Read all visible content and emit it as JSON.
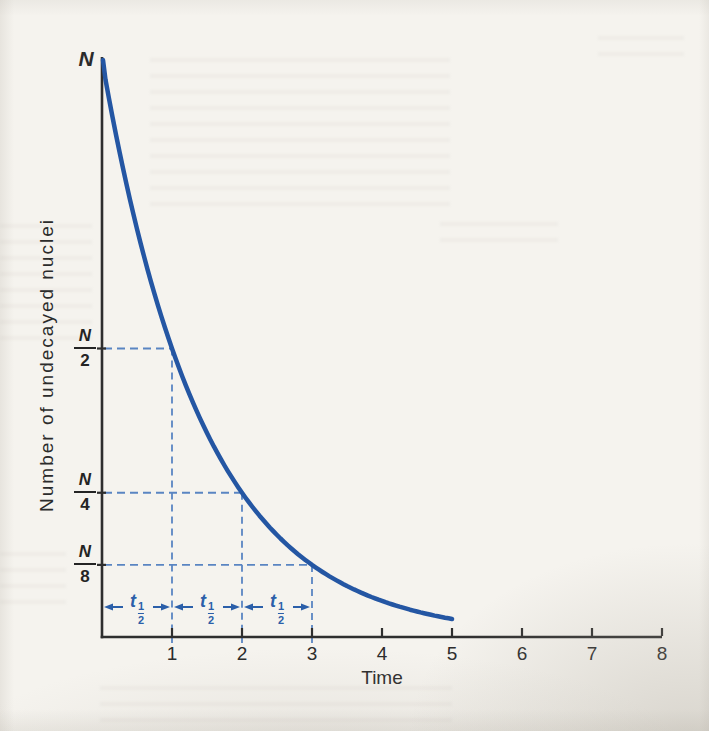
{
  "chart": {
    "top_label": "N",
    "xlabel": "Time",
    "ylabel": "Number of undecayed nuclei",
    "fractions": [
      {
        "num": "N",
        "den": "2"
      },
      {
        "num": "N",
        "den": "4"
      },
      {
        "num": "N",
        "den": "8"
      }
    ],
    "half_life": {
      "base": "t",
      "num": "1",
      "den": "2"
    }
  },
  "chart_data": {
    "type": "line",
    "title": "",
    "xlabel": "Time",
    "ylabel": "Number of undecayed nuclei",
    "xlim": [
      0,
      8
    ],
    "ylim": [
      0,
      1
    ],
    "x_ticks": [
      1,
      2,
      3,
      4,
      5,
      6,
      7,
      8
    ],
    "grid": false,
    "y_unit": "N",
    "curve": {
      "name": "radioactive-decay",
      "equation": "N(t) = N · (1/2)^t",
      "half_life": 1,
      "t_range": [
        0,
        5
      ],
      "key_points": [
        {
          "t": 0,
          "value_label": "N",
          "fraction_of_N": 1
        },
        {
          "t": 1,
          "value_label": "N/2",
          "fraction_of_N": 0.5
        },
        {
          "t": 2,
          "value_label": "N/4",
          "fraction_of_N": 0.25
        },
        {
          "t": 3,
          "value_label": "N/8",
          "fraction_of_N": 0.125
        },
        {
          "t": 5,
          "value_label": "N/32",
          "fraction_of_N": 0.03125
        }
      ]
    },
    "guides": [
      {
        "t": 1,
        "level": 0.5
      },
      {
        "t": 2,
        "level": 0.25
      },
      {
        "t": 3,
        "level": 0.125
      }
    ],
    "half_life_intervals": [
      [
        0,
        1
      ],
      [
        1,
        2
      ],
      [
        2,
        3
      ]
    ],
    "colors": {
      "curve": "#2456a3",
      "dashed": "#5a85c2",
      "annotation": "#2b5fa9",
      "axis": "#2e2e2e",
      "paper": "#f5f3ee"
    }
  }
}
